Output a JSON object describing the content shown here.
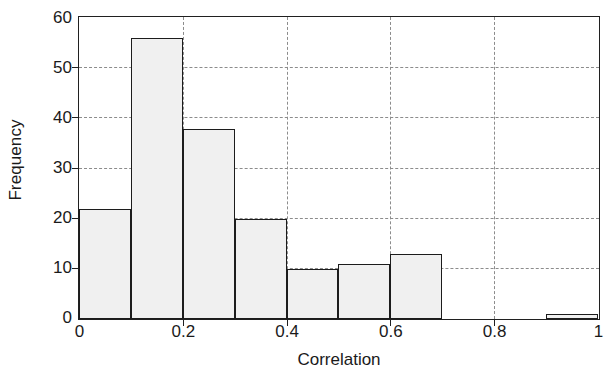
{
  "chart_data": {
    "type": "bar",
    "title": "",
    "subtitle": "",
    "xlabel": "Correlation",
    "ylabel": "Frequency",
    "xlim": [
      0,
      1
    ],
    "ylim": [
      0,
      60
    ],
    "grid": true,
    "legend": null,
    "legend_position": "none",
    "bin_width": 0.1,
    "bin_edges": [
      0,
      0.1,
      0.2,
      0.3,
      0.4,
      0.5,
      0.6,
      0.7,
      0.9,
      1.0
    ],
    "categories": [
      "0.0-0.1",
      "0.1-0.2",
      "0.2-0.3",
      "0.3-0.4",
      "0.4-0.5",
      "0.5-0.6",
      "0.6-0.7",
      "0.9-1.0"
    ],
    "values": [
      22,
      56,
      38,
      20,
      10,
      11,
      13,
      1
    ],
    "bars": [
      {
        "x0": 0.0,
        "x1": 0.1,
        "value": 22
      },
      {
        "x0": 0.1,
        "x1": 0.2,
        "value": 56
      },
      {
        "x0": 0.2,
        "x1": 0.3,
        "value": 38
      },
      {
        "x0": 0.3,
        "x1": 0.4,
        "value": 20
      },
      {
        "x0": 0.4,
        "x1": 0.5,
        "value": 10
      },
      {
        "x0": 0.5,
        "x1": 0.6,
        "value": 11
      },
      {
        "x0": 0.6,
        "x1": 0.7,
        "value": 13
      },
      {
        "x0": 0.9,
        "x1": 1.0,
        "value": 1
      }
    ],
    "xticks": [
      0,
      0.2,
      0.4,
      0.6,
      0.8,
      1
    ],
    "xtick_labels": [
      "0",
      "0.2",
      "0.4",
      "0.6",
      "0.8",
      "1"
    ],
    "yticks": [
      0,
      10,
      20,
      30,
      40,
      50,
      60
    ],
    "ytick_labels": [
      "0",
      "10",
      "20",
      "30",
      "40",
      "50",
      "60"
    ],
    "gridlines_x": [
      0.2,
      0.4,
      0.6,
      0.8
    ],
    "gridlines_y": [
      10,
      20,
      30,
      40,
      50
    ],
    "colors": {
      "bar_fill": "#f0f0f0",
      "bar_edge": "#1c1c1c",
      "axis": "#202020",
      "grid": "#8c8c8c",
      "background": "#ffffff",
      "text": "#1a1a1a"
    }
  }
}
